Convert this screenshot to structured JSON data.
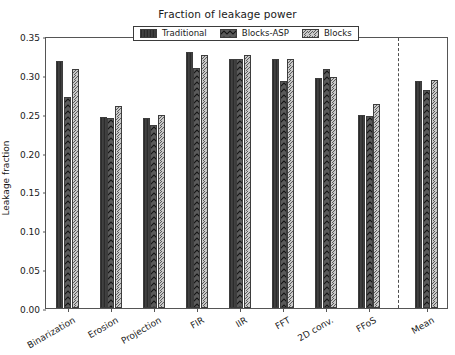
{
  "chart_data": {
    "type": "bar",
    "title": "Fraction of leakage power",
    "xlabel": "",
    "ylabel": "Leakage fraction",
    "ylim": [
      0.0,
      0.35
    ],
    "yticks": [
      "0.00",
      "0.05",
      "0.10",
      "0.15",
      "0.20",
      "0.25",
      "0.30",
      "0.35"
    ],
    "ytick_values": [
      0.0,
      0.05,
      0.1,
      0.15,
      0.2,
      0.25,
      0.3,
      0.35
    ],
    "grid": false,
    "legend_position": "upper center",
    "categories": [
      "Binarization",
      "Erosion",
      "Projection",
      "FIR",
      "IIR",
      "FFT",
      "2D conv.",
      "FFoS",
      "Mean"
    ],
    "series": [
      {
        "name": "Traditional",
        "color": "#5a5a5a",
        "hatch": "vertical-lines",
        "values": [
          0.318,
          0.246,
          0.245,
          0.33,
          0.321,
          0.32,
          0.296,
          0.248,
          0.292
        ]
      },
      {
        "name": "Blocks-ASP",
        "color": "#5a5a5a",
        "hatch": "diagonal-chevron",
        "values": [
          0.271,
          0.245,
          0.236,
          0.309,
          0.321,
          0.292,
          0.307,
          0.247,
          0.28
        ]
      },
      {
        "name": "Blocks",
        "color": "#c9c9c9",
        "hatch": "forward-diagonal",
        "values": [
          0.307,
          0.26,
          0.248,
          0.326,
          0.325,
          0.32,
          0.297,
          0.262,
          0.294
        ]
      }
    ],
    "annotations": [
      {
        "name": "mean-separator",
        "type": "vertical-dashed-line",
        "after_category": "FFoS"
      }
    ]
  }
}
